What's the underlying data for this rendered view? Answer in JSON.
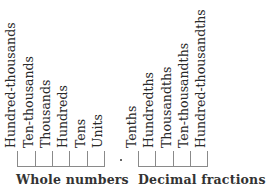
{
  "whole_numbers": {
    "group_label": "Whole numbers",
    "places": [
      "Hundred-thousands",
      "Ten-thousands",
      "Thousands",
      "Hundreds",
      "Tens",
      "Units"
    ]
  },
  "decimal_point": ".",
  "decimal_fractions": {
    "group_label": "Decimal fractions",
    "places": [
      "Tenths",
      "Hundredths",
      "Thousandths",
      "Ten-thousandths",
      "Hundred-thousandths"
    ]
  }
}
